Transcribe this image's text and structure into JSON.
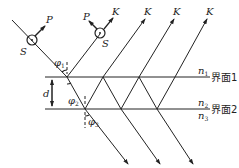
{
  "diagram": {
    "title": "",
    "labels": {
      "P1": "P",
      "P2": "P",
      "S1": "S",
      "S2": "S",
      "K": [
        "K",
        "K",
        "K",
        "K"
      ],
      "phi1": "φ",
      "phi1_sub": "1",
      "phi2": "φ",
      "phi2_sub": "2",
      "phi3": "φ",
      "phi3_sub": "3",
      "d": "d",
      "n1": "n",
      "n1_sub": "1",
      "n2": "n",
      "n2_sub": "2",
      "n3": "n",
      "n3_sub": "3",
      "interface1": "界面1",
      "interface2": "界面2"
    },
    "colors": {
      "line": "#222222",
      "background": "#ffffff"
    }
  }
}
